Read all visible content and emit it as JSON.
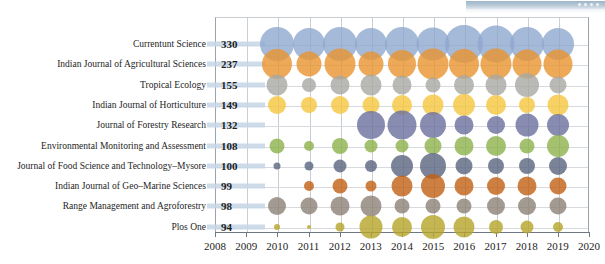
{
  "window": {
    "titlebar_present": true,
    "dots": 4
  },
  "chart_data": {
    "type": "scatter",
    "subtype": "bubble-matrix",
    "title": "",
    "subtitle": "",
    "xlabel": "",
    "ylabel": "",
    "grid": true,
    "legend_position": "none",
    "xlim": [
      2008,
      2020
    ],
    "x_ticks": [
      2008,
      2009,
      2010,
      2011,
      2012,
      2013,
      2014,
      2015,
      2016,
      2017,
      2018,
      2019,
      2020
    ],
    "categories": [
      "Currentunt  Science",
      "Indian Journal of Agricultural Sciences",
      "Tropical Ecology",
      "Indian Journal of Horticulture",
      "Journal of Forestry Research",
      "Environmental Monitoring and Assessment",
      "Journal of Food Science and Technology–Mysore",
      "Indian Journal of Geo–Marine Sciences",
      "Range Management and Agroforestry",
      "Plos One"
    ],
    "category_totals": [
      330,
      237,
      155,
      149,
      132,
      108,
      100,
      99,
      98,
      94
    ],
    "colors": [
      "#8fa8ce",
      "#e8932e",
      "#a8a9a4",
      "#f5c63c",
      "#6b6f9e",
      "#8cb24a",
      "#5a6480",
      "#c25f13",
      "#8c8175",
      "#b6a429"
    ],
    "series": [
      {
        "name": "Currentunt  Science",
        "x": [
          2010,
          2011,
          2012,
          2013,
          2014,
          2015,
          2016,
          2017,
          2018,
          2019
        ],
        "values": [
          34,
          32,
          34,
          32,
          34,
          33,
          38,
          37,
          34,
          32
        ]
      },
      {
        "name": "Indian Journal of Agricultural Sciences",
        "x": [
          2010,
          2011,
          2012,
          2013,
          2014,
          2015,
          2016,
          2017,
          2018,
          2019
        ],
        "values": [
          30,
          25,
          31,
          25,
          28,
          31,
          30,
          31,
          29,
          29
        ]
      },
      {
        "name": "Tropical Ecology",
        "x": [
          2010,
          2011,
          2012,
          2013,
          2014,
          2015,
          2016,
          2017,
          2018,
          2019
        ],
        "values": [
          21,
          14,
          19,
          21,
          19,
          15,
          20,
          21,
          24,
          17
        ]
      },
      {
        "name": "Indian Journal of Horticulture",
        "x": [
          2010,
          2011,
          2012,
          2013,
          2014,
          2015,
          2016,
          2017,
          2018,
          2019
        ],
        "values": [
          18,
          16,
          18,
          17,
          20,
          21,
          22,
          20,
          16,
          21
        ]
      },
      {
        "name": "Journal of Forestry Research",
        "x": [
          2013,
          2014,
          2015,
          2016,
          2017,
          2018,
          2019
        ],
        "values": [
          28,
          29,
          26,
          19,
          18,
          23,
          22
        ]
      },
      {
        "name": "Environmental Monitoring and Assessment",
        "x": [
          2010,
          2011,
          2012,
          2013,
          2014,
          2015,
          2016,
          2017,
          2018,
          2019
        ],
        "values": [
          15,
          10,
          16,
          13,
          13,
          17,
          19,
          20,
          15,
          22
        ]
      },
      {
        "name": "Journal of Food Science and Technology–Mysore",
        "x": [
          2010,
          2011,
          2012,
          2013,
          2014,
          2015,
          2016,
          2017,
          2018,
          2019
        ],
        "values": [
          7,
          9,
          13,
          12,
          22,
          26,
          17,
          16,
          16,
          18
        ]
      },
      {
        "name": "Indian Journal of Geo–Marine Sciences",
        "x": [
          2011,
          2012,
          2013,
          2014,
          2015,
          2016,
          2017,
          2018,
          2019
        ],
        "values": [
          10,
          15,
          11,
          21,
          24,
          19,
          18,
          19,
          17
        ]
      },
      {
        "name": "Range Management and Agroforestry",
        "x": [
          2010,
          2011,
          2012,
          2013,
          2014,
          2015,
          2016,
          2017,
          2018,
          2019
        ],
        "values": [
          18,
          17,
          19,
          21,
          15,
          15,
          15,
          18,
          18,
          17
        ]
      },
      {
        "name": "Plos One",
        "x": [
          2010,
          2011,
          2012,
          2013,
          2014,
          2015,
          2016,
          2017,
          2018,
          2019
        ],
        "values": [
          6,
          4,
          9,
          23,
          20,
          24,
          21,
          14,
          13,
          10
        ]
      }
    ]
  }
}
